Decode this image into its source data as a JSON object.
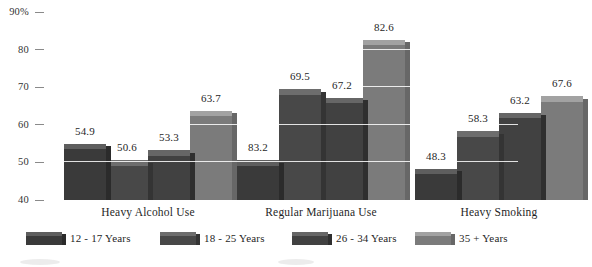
{
  "chart_data": {
    "type": "bar",
    "title": "",
    "xlabel": "",
    "ylabel": "",
    "ylim": [
      40,
      90
    ],
    "grid": true,
    "legend_position": "bottom",
    "style": "3d-grouped-bars",
    "yticks": [
      {
        "value": 90,
        "label": "90%"
      },
      {
        "value": 80,
        "label": "80"
      },
      {
        "value": 70,
        "label": "70"
      },
      {
        "value": 60,
        "label": "60"
      },
      {
        "value": 50,
        "label": "50"
      },
      {
        "value": 40,
        "label": "40"
      }
    ],
    "categories": [
      "Heavy Alcohol Use",
      "Regular Marijuana Use",
      "Heavy Smoking"
    ],
    "series": [
      {
        "name": "12 - 17 Years",
        "color": "#3a3a3a",
        "top_color": "#5e5e5e",
        "side_color": "#2b2b2b",
        "values": [
          54.9,
          50.6,
          48.3
        ]
      },
      {
        "name": "18 - 25 Years",
        "color": "#484848",
        "top_color": "#6d6d6d",
        "side_color": "#343434",
        "values": [
          50.6,
          69.5,
          58.3
        ]
      },
      {
        "name": "26 - 34 Years",
        "color": "#414141",
        "top_color": "#666666",
        "side_color": "#2f2f2f",
        "values": [
          53.3,
          67.2,
          63.2
        ]
      },
      {
        "name": "35 + Years",
        "color": "#7b7b7b",
        "top_color": "#a2a2a2",
        "side_color": "#676767",
        "values": [
          63.7,
          82.6,
          67.6
        ]
      }
    ],
    "data_labels": [
      [
        "54.9",
        "50.6",
        "53.3",
        "63.7"
      ],
      [
        "83.2",
        "69.5",
        "67.2",
        "82.6"
      ],
      [
        "48.3",
        "58.3",
        "63.2",
        "67.6"
      ]
    ]
  },
  "legend": {
    "items": [
      {
        "label": "12 - 17 Years"
      },
      {
        "label": "18 - 25 Years"
      },
      {
        "label": "26 - 34 Years"
      },
      {
        "label": "35 + Years"
      }
    ]
  }
}
